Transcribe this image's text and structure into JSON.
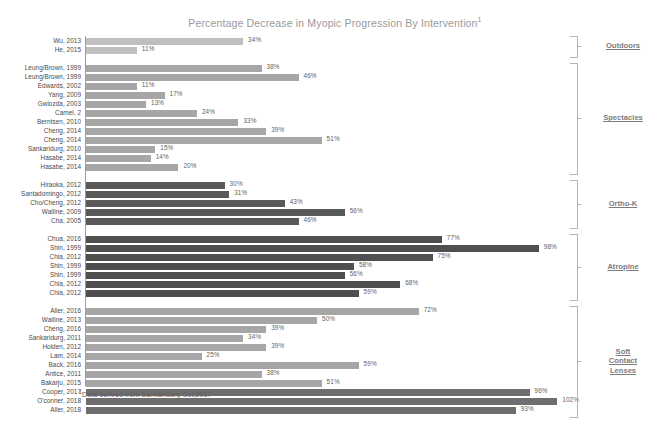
{
  "chart_data": {
    "type": "bar",
    "orientation": "horizontal",
    "title": "Percentage Decrease in Myopic Progression By Intervention",
    "title_superscript": "1",
    "xlabel": "",
    "ylabel": "",
    "xlim": [
      0,
      105
    ],
    "grid": false,
    "legend": "none",
    "footnote": "Data derived from Sankaridurg Oct,2017",
    "footnote_superscript": "1",
    "units": "%",
    "colors": {
      "outdoors": "#bfbfbf",
      "spectacles": "#a6a6a6",
      "ortho_k": "#595959",
      "atropine": "#4f4f4f",
      "soft_contact_lenses_light": "#a6a6a6",
      "soft_contact_lenses_dark": "#6e6e6e",
      "axis": "#9c9c9c",
      "title": "#9a9a9a",
      "group_label": "#7d7d7d"
    },
    "groups": [
      {
        "name": "Outdoors",
        "color": "#bfbfbf",
        "categories": [
          "Wu, 2013",
          "He, 2015"
        ],
        "values": [
          34,
          11
        ],
        "labels": [
          "34%",
          "11%"
        ]
      },
      {
        "name": "Spectacles",
        "color": "#a6a6a6",
        "categories": [
          "Leung/Brown, 1999",
          "Leung/Brown, 1999",
          "Edwards, 2002",
          "Yang, 2009",
          "Gwiozda, 2003",
          "Camel, 2",
          "Berntsen, 2010",
          "Cheng, 2014",
          "Cheng, 2014",
          "Sankaridurg, 2010",
          "Hasabe, 2014",
          "Hasabe, 2014"
        ],
        "values": [
          38,
          46,
          11,
          17,
          13,
          24,
          33,
          39,
          51,
          15,
          14,
          20
        ],
        "labels": [
          "38%",
          "46%",
          "11%",
          "17%",
          "13%",
          "24%",
          "33%",
          "39%",
          "51%",
          "15%",
          "14%",
          "20%"
        ]
      },
      {
        "name": "Ortho-K",
        "color": "#595959",
        "categories": [
          "Hiraoka, 2012",
          "Santadomingo, 2012",
          "Cho/Cheng, 2012",
          "Walline, 2009",
          "Cha, 2005"
        ],
        "values": [
          30,
          31,
          43,
          56,
          46
        ],
        "labels": [
          "30%",
          "31%",
          "43%",
          "56%",
          "46%"
        ]
      },
      {
        "name": "Atropine",
        "color": "#4f4f4f",
        "categories": [
          "Chua, 2016",
          "Shin, 1999",
          "Chia, 2012",
          "Shin, 1999",
          "Shin, 1999",
          "Chia, 2012",
          "Chia, 2012"
        ],
        "values": [
          77,
          98,
          75,
          58,
          56,
          68,
          59
        ],
        "labels": [
          "77%",
          "98%",
          "75%",
          "58%",
          "56%",
          "68%",
          "59%"
        ]
      },
      {
        "name": "Soft Contact Lenses",
        "name_lines": [
          "Soft",
          "Contact",
          "Lenses"
        ],
        "color": "#a6a6a6",
        "categories": [
          "Aller, 2016",
          "Walline, 2013",
          "Cheng, 2016",
          "Sankaridurg, 2011",
          "Holden, 2012",
          "Lam, 2014",
          "Back, 2016",
          "Antice, 2011",
          "Bakarju, 2015",
          "Cooper, 2017",
          "O'conner, 2018",
          "Aller, 2018"
        ],
        "values": [
          72,
          50,
          39,
          34,
          39,
          25,
          59,
          38,
          51,
          96,
          102,
          93
        ],
        "labels": [
          "72%",
          "50%",
          "39%",
          "34%",
          "39%",
          "25%",
          "59%",
          "38%",
          "51%",
          "96%",
          "102%",
          "93%"
        ],
        "shades": [
          "light",
          "light",
          "light",
          "light",
          "light",
          "light",
          "light",
          "light",
          "light",
          "dark",
          "dark",
          "dark"
        ]
      }
    ]
  }
}
